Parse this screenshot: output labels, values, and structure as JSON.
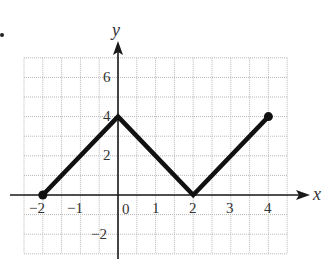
{
  "chart_data": {
    "type": "line",
    "title": "",
    "xlabel": "x",
    "ylabel": "y",
    "xlim": [
      -2.5,
      4.5
    ],
    "ylim": [
      -3,
      7
    ],
    "grid": true,
    "grid_step": {
      "x": 0.5,
      "y": 1
    },
    "x_ticks": [
      -2,
      -1,
      0,
      1,
      2,
      3,
      4
    ],
    "x_tick_labels": [
      "−2",
      "−1",
      "0",
      "1",
      "2",
      "3",
      "4"
    ],
    "y_ticks": [
      -2,
      2,
      4,
      6
    ],
    "y_tick_labels": [
      "−2",
      "2",
      "4",
      "6"
    ],
    "series": [
      {
        "name": "piecewise",
        "points": [
          [
            -2,
            0
          ],
          [
            0,
            4
          ],
          [
            2,
            0
          ],
          [
            4,
            4
          ]
        ],
        "endpoints_closed": [
          [
            -2,
            0
          ],
          [
            4,
            4
          ]
        ],
        "color": "#111111"
      }
    ]
  },
  "labels": {
    "x_axis": "x",
    "y_axis": "y",
    "xticks": {
      "m2": "−2",
      "m1": "−1",
      "z": "0",
      "p1": "1",
      "p2": "2",
      "p3": "3",
      "p4": "4"
    },
    "yticks": {
      "m2": "−2",
      "p2": "2",
      "p4": "4",
      "p6": "6"
    }
  }
}
